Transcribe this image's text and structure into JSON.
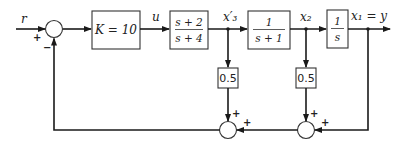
{
  "diagram": {
    "input_label": "r",
    "output_label": "x₁ = y",
    "left_sum": {
      "signs": {
        "input": "+",
        "feedback": "−"
      }
    },
    "blocks": [
      {
        "id": "gain",
        "label": "K = 10"
      },
      {
        "id": "lead",
        "numerator": "s + 2",
        "denominator": "s + 4"
      },
      {
        "id": "lag",
        "numerator": "1",
        "denominator": "s + 1"
      },
      {
        "id": "integrator",
        "numerator": "1",
        "denominator": "s"
      }
    ],
    "signals": {
      "u": "u",
      "x3": "x′₃",
      "x2": "x₂"
    },
    "feedback_gains": [
      {
        "id": "gain-x3",
        "label": "0.5"
      },
      {
        "id": "gain-x2",
        "label": "0.5"
      }
    ],
    "bottom_sums": [
      {
        "id": "sum-mid",
        "signs": {
          "top": "+",
          "right": "+"
        }
      },
      {
        "id": "sum-right",
        "signs": {
          "top": "+",
          "right": "+"
        }
      }
    ]
  }
}
